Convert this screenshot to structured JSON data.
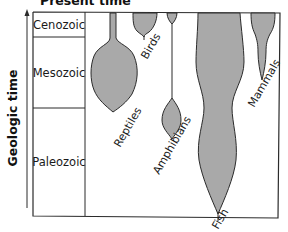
{
  "title": "Present time",
  "axis": {
    "label": "Geologic time",
    "direction": "up"
  },
  "eras": [
    {
      "name": "Cenozoic"
    },
    {
      "name": "Mesozoic"
    },
    {
      "name": "Paleozoic"
    }
  ],
  "clades": [
    {
      "name": "Reptiles"
    },
    {
      "name": "Birds"
    },
    {
      "name": "Amphibians"
    },
    {
      "name": "Fish"
    },
    {
      "name": "Mammals"
    }
  ],
  "colors": {
    "fill": "#a9a9a9",
    "stroke": "#2b2b2b"
  }
}
